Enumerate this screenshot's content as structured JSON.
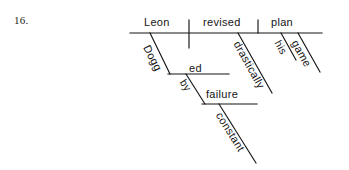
{
  "page": {
    "item_number": "16.",
    "background_color": "#ffffff",
    "ink_color": "#151515"
  },
  "diagram": {
    "type": "reed-kellogg-sentence-diagram",
    "sentence": "Dogged by constant failure, Leon drastically revised his game plan.",
    "baseline": {
      "subject": "Leon",
      "verb": "revised",
      "direct_object": "plan"
    },
    "modifiers": [
      {
        "word": "Dogged",
        "attaches_to": "Leon",
        "role": "participle"
      },
      {
        "word": "by",
        "attaches_to": "Dogged",
        "role": "preposition"
      },
      {
        "word": "failure",
        "attaches_to": "by",
        "role": "object-of-preposition"
      },
      {
        "word": "constant",
        "attaches_to": "failure",
        "role": "adjective"
      },
      {
        "word": "drastically",
        "attaches_to": "revised",
        "role": "adverb"
      },
      {
        "word": "his",
        "attaches_to": "plan",
        "role": "possessive-adjective"
      },
      {
        "word": "game",
        "attaches_to": "plan",
        "role": "adjective"
      }
    ],
    "labels": {
      "leon": "Leon",
      "revised": "revised",
      "plan": "plan",
      "dogged_slant": "Dogg",
      "dogged_flat": "ed",
      "by": "by",
      "failure": "failure",
      "constant": "constant",
      "drastically": "drastically",
      "his": "his",
      "game": "game"
    }
  }
}
